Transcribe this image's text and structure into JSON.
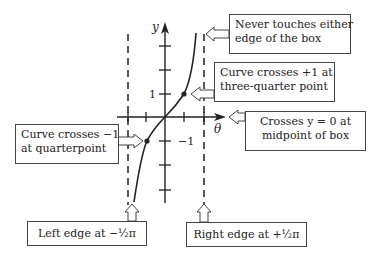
{
  "axes": {
    "x_label": "θ",
    "y_label": "y",
    "tick_label_pos": "1",
    "tick_label_neg": "−1"
  },
  "notes": {
    "never_touches": {
      "line1": "Never touches either",
      "line2": "edge of the box"
    },
    "crosses_plus1": {
      "line1": "Curve crosses +1 at",
      "line2": "three-quarter point"
    },
    "crosses_zero": {
      "line1": "Crosses y = 0 at",
      "line2": "midpoint of box"
    },
    "crosses_minus1": {
      "line1": "Curve crosses −1",
      "line2": "at quarterpoint"
    },
    "left_edge": {
      "text": "Left edge at −½π"
    },
    "right_edge": {
      "text": "Right edge at +½π"
    }
  },
  "colors": {
    "ink": "#222222",
    "background": "#ffffff"
  }
}
